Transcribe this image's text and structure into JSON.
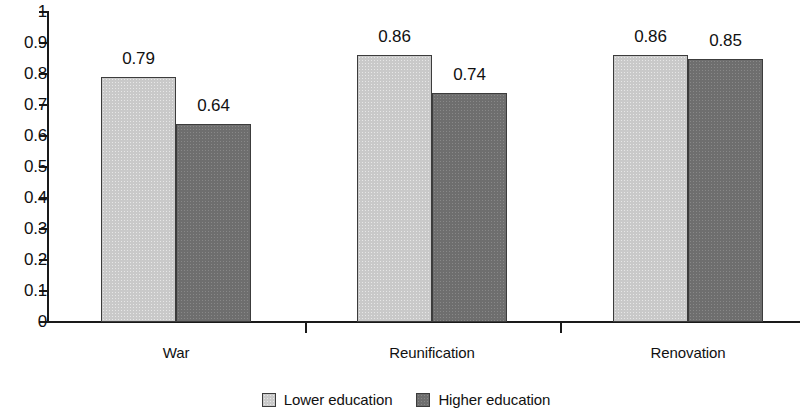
{
  "chart_data": {
    "type": "bar",
    "title": "",
    "subtitle": "",
    "xlabel": "",
    "ylabel": "",
    "categories": [
      "War",
      "Reunification",
      "Renovation"
    ],
    "series": [
      {
        "name": "Lower education",
        "color": "#c9c9c9",
        "values": [
          0.79,
          0.86,
          0.86
        ],
        "labels": [
          "0.79",
          "0.86",
          "0.86"
        ]
      },
      {
        "name": "Higher education",
        "color": "#6e6e6e",
        "values": [
          0.64,
          0.74,
          0.85
        ],
        "labels": [
          "0.64",
          "0.74",
          "0.85"
        ]
      }
    ],
    "ylim": [
      0,
      1
    ],
    "y_ticks": [
      0,
      0.1,
      0.2,
      0.3,
      0.4,
      0.5,
      0.6,
      0.7,
      0.8,
      0.9,
      1
    ],
    "y_tick_labels": [
      "0",
      "0.1",
      "0.2",
      "0.3",
      "0.4",
      "0.5",
      "0.6",
      "0.7",
      "0.8",
      "0.9",
      "1"
    ],
    "grid": false,
    "legend_position": "bottom",
    "bar_value_labels_shown": true,
    "axis_color": "#1a1a1a",
    "bar_border_color": "#3c3c3c",
    "background": "#ffffff"
  },
  "legend": {
    "items": [
      {
        "label": "Lower education",
        "swatch": "light"
      },
      {
        "label": "Higher education",
        "swatch": "dark"
      }
    ]
  }
}
